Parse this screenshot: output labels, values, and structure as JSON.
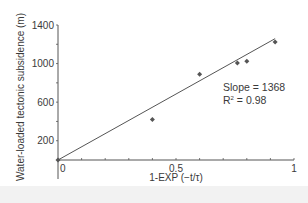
{
  "chart_data": {
    "type": "scatter",
    "title": "",
    "xlabel": "1-EXP (−t/τ)",
    "ylabel": "Water-loaded tectonic subsidence (m)",
    "xlim": [
      0,
      1
    ],
    "ylim": [
      0,
      1400
    ],
    "x_ticks": [
      "0",
      "0.5",
      "1"
    ],
    "y_ticks": [
      "200",
      "600",
      "1000",
      "1400"
    ],
    "grid": false,
    "legend": null,
    "series": [
      {
        "name": "data",
        "x": [
          0,
          0.4,
          0.6,
          0.76,
          0.8,
          0.92
        ],
        "y": [
          0,
          420,
          890,
          1005,
          1025,
          1225
        ]
      }
    ],
    "fit_line": {
      "slope": 1368,
      "intercept": 0,
      "x_range": [
        0,
        0.92
      ]
    },
    "annotations": [
      "Slope = 1368",
      "R² = 0.98"
    ]
  },
  "labels": {
    "slope": "Slope = 1368",
    "r2_prefix": "R",
    "r2_sup": "2",
    "r2_value": " = 0.98"
  }
}
